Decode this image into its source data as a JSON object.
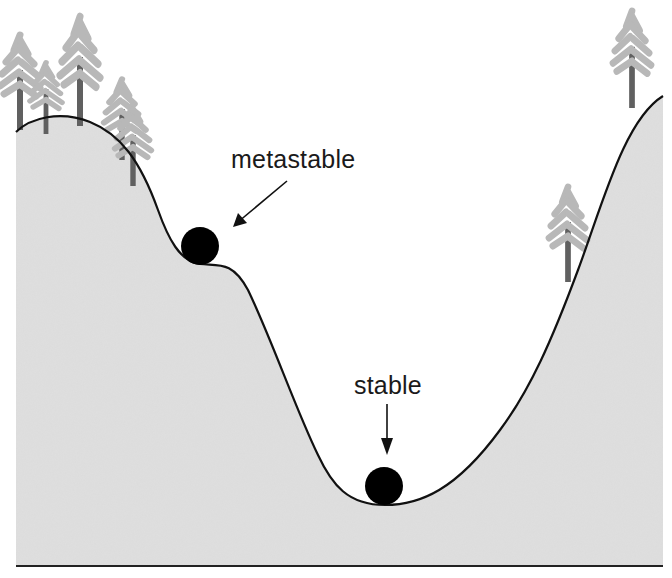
{
  "diagram": {
    "type": "energy-landscape",
    "labels": {
      "metastable": "metastable",
      "stable": "stable"
    },
    "balls": [
      {
        "state": "metastable",
        "cx": 200,
        "cy": 246,
        "r": 19
      },
      {
        "state": "stable",
        "cx": 384,
        "cy": 486,
        "r": 19
      }
    ],
    "colors": {
      "terrain_fill": "#dcdcdc",
      "outline": "#111111",
      "ball": "#000000",
      "tree_foliage": "#b8b8b8",
      "tree_trunk": "#606060",
      "background": "#ffffff"
    },
    "trees": [
      {
        "x": 20,
        "base": 130,
        "height": 95
      },
      {
        "x": 46,
        "base": 132,
        "height": 72
      },
      {
        "x": 80,
        "base": 125,
        "height": 110
      },
      {
        "x": 122,
        "base": 158,
        "height": 80
      },
      {
        "x": 133,
        "base": 185,
        "height": 78
      },
      {
        "x": 568,
        "base": 280,
        "height": 95
      },
      {
        "x": 632,
        "base": 108,
        "height": 98
      }
    ]
  }
}
